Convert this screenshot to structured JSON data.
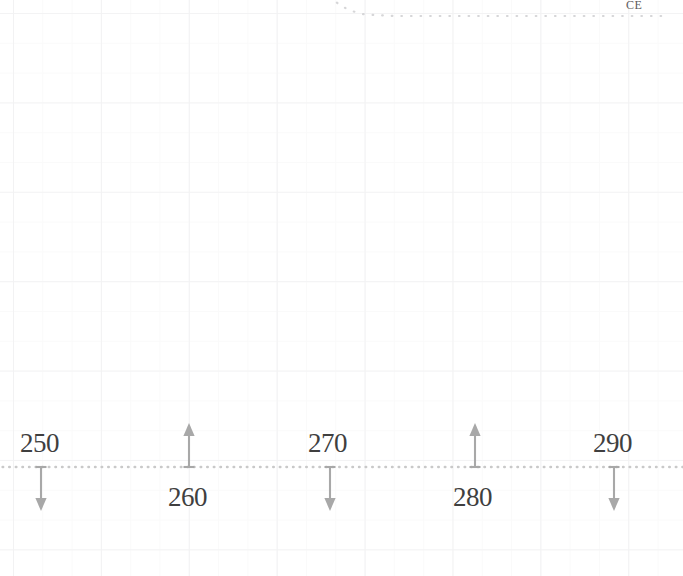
{
  "chart_data": {
    "type": "scatter",
    "title": "",
    "subtitle": "",
    "xlabel": "",
    "ylabel": "",
    "axis_annotation": "CE",
    "grid": true,
    "grid_minor_spacing_px": 29,
    "grid_major_spacing_px": 88,
    "baseline": {
      "label": "dotted baseline",
      "y_px": 467,
      "style": "dotted",
      "color": "#c9c9c9"
    },
    "curve": {
      "name": "decaying dotted curve",
      "style": "dotted",
      "color": "#d6d6d8",
      "points_px": [
        [
          330,
          -4
        ],
        [
          336,
          2
        ],
        [
          343,
          7
        ],
        [
          352,
          11
        ],
        [
          362,
          14
        ],
        [
          375,
          15
        ],
        [
          395,
          16
        ],
        [
          430,
          16
        ],
        [
          470,
          16
        ],
        [
          510,
          16
        ],
        [
          550,
          16
        ],
        [
          590,
          16
        ],
        [
          630,
          16
        ],
        [
          670,
          16
        ]
      ]
    },
    "markers": [
      {
        "label": "250",
        "x_px": 41,
        "direction": "down",
        "label_side": "above",
        "label_x_px": 20,
        "label_y_px": 430
      },
      {
        "label": "260",
        "x_px": 189,
        "direction": "up",
        "label_side": "below",
        "label_x_px": 168,
        "label_y_px": 484
      },
      {
        "label": "270",
        "x_px": 330,
        "direction": "down",
        "label_side": "above",
        "label_x_px": 308,
        "label_y_px": 430
      },
      {
        "label": "280",
        "x_px": 475,
        "direction": "up",
        "label_side": "below",
        "label_x_px": 453,
        "label_y_px": 484
      },
      {
        "label": "290",
        "x_px": 614,
        "direction": "down",
        "label_side": "above",
        "label_x_px": 593,
        "label_y_px": 430
      }
    ],
    "marker_values": [
      250,
      260,
      270,
      280,
      290
    ],
    "xlim_implied": [
      245,
      295
    ],
    "legend": null,
    "colors": {
      "marker_arrow": "#a8a8a8",
      "marker_label": "#3f3f3f",
      "baseline": "#c9c9c9",
      "grid_minor": "#fafafa",
      "grid_major": "#f2f2f3",
      "background": "#ffffff",
      "annotation": "#5b5b5b"
    }
  }
}
